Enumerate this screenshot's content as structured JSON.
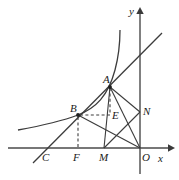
{
  "figure": {
    "kind": "geometry-diagram",
    "background_color": "#ffffff",
    "stroke_color": "#3c3c3c",
    "axis_color": "#4a4a4a",
    "label_color": "#1a1a1a",
    "width": 179,
    "height": 180
  },
  "axes": {
    "x_axis_label": "x",
    "y_axis_label": "y",
    "origin_label": "O",
    "x_axis_y_pixel": 148,
    "y_axis_x_pixel": 140,
    "x_axis_start": 8,
    "x_axis_end": 172,
    "y_axis_top": 8,
    "y_axis_bottom": 174
  },
  "points": [
    {
      "label": "A",
      "x": 110,
      "y": 87,
      "label_x": 103,
      "label_y": 74,
      "marked": true
    },
    {
      "label": "B",
      "x": 78,
      "y": 115,
      "label_x": 70,
      "label_y": 103,
      "marked": true
    },
    {
      "label": "E",
      "x": 110,
      "y": 115,
      "label_x": 112,
      "label_y": 110,
      "marked": false
    },
    {
      "label": "N",
      "x": 140,
      "y": 112,
      "label_x": 143,
      "label_y": 106,
      "marked": false
    },
    {
      "label": "M",
      "x": 104,
      "y": 148,
      "label_x": 99,
      "label_y": 158,
      "marked": false
    },
    {
      "label": "F",
      "x": 78,
      "y": 148,
      "label_x": 73,
      "label_y": 158,
      "marked": false
    },
    {
      "label": "C",
      "x": 48,
      "y": 148,
      "label_x": 42,
      "label_y": 158,
      "marked": false
    },
    {
      "label": "O",
      "x": 140,
      "y": 148,
      "label_x": 141,
      "label_y": 158,
      "marked": false
    }
  ],
  "curves": [
    {
      "name": "hyperbola",
      "style": "solid",
      "path": "M 18 130 C 40 126 62 121 78 115 C 96 108 108 96 115 70 C 119 55 120 42 120 30"
    },
    {
      "name": "secant-line-CBA",
      "style": "solid",
      "path": "M 33 163 L 162 33"
    }
  ],
  "segments": [
    {
      "name": "segment-A-N",
      "style": "solid",
      "x1": 110,
      "y1": 87,
      "x2": 140,
      "y2": 112
    },
    {
      "name": "segment-A-O",
      "style": "solid",
      "x1": 110,
      "y1": 87,
      "x2": 140,
      "y2": 148
    },
    {
      "name": "segment-A-M",
      "style": "solid",
      "x1": 110,
      "y1": 87,
      "x2": 104,
      "y2": 148
    },
    {
      "name": "segment-B-O",
      "style": "solid",
      "x1": 78,
      "y1": 115,
      "x2": 140,
      "y2": 148
    },
    {
      "name": "segment-N-M",
      "style": "solid",
      "x1": 140,
      "y1": 112,
      "x2": 104,
      "y2": 148
    },
    {
      "name": "segment-A-E",
      "style": "dashed",
      "x1": 110,
      "y1": 87,
      "x2": 110,
      "y2": 115
    },
    {
      "name": "segment-B-E",
      "style": "dashed",
      "x1": 78,
      "y1": 115,
      "x2": 110,
      "y2": 115
    },
    {
      "name": "segment-B-F",
      "style": "dashed",
      "x1": 78,
      "y1": 115,
      "x2": 78,
      "y2": 148
    }
  ]
}
